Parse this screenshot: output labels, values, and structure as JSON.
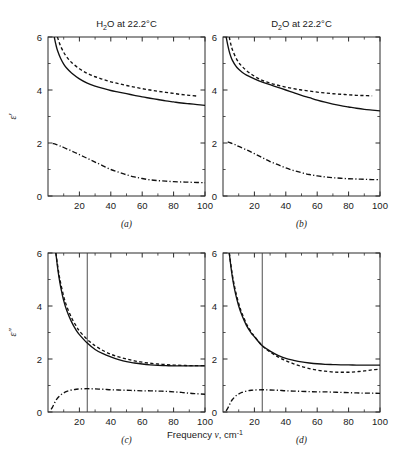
{
  "figure": {
    "x_axis_label_prefix": "Frequency ",
    "x_axis_label_symbol": "ν",
    "x_axis_label_unit": ", cm",
    "x_axis_label_unit_exp": "-1",
    "y_label_top": "ε′",
    "y_label_bottom": "ε″",
    "line_color": "#111111",
    "axis_color": "#2b2b2b"
  },
  "chart_data": [
    {
      "id": "a",
      "type": "line",
      "panel_letter": "(a)",
      "title_main": "H",
      "title_sub": "2",
      "title_rest": "O at 22.2°C",
      "title": "H2O at 22.2°C",
      "xlabel": "Frequency ν, cm-1",
      "ylabel": "ε′",
      "xlim": [
        0,
        100
      ],
      "ylim": [
        0,
        6
      ],
      "xticks": [
        20,
        40,
        60,
        80,
        100
      ],
      "xticklabels": [
        "20",
        "40",
        "60",
        "80",
        "100"
      ],
      "yticks": [
        0,
        2,
        4,
        6
      ],
      "yticklabels": [
        "0",
        "2",
        "4",
        "6"
      ],
      "grid": false,
      "legend": "none",
      "marker_line_x": null,
      "series": [
        {
          "name": "solid",
          "style": "solid",
          "x": [
            4,
            5,
            6,
            8,
            10,
            12,
            15,
            20,
            25,
            30,
            35,
            40,
            45,
            50,
            55,
            60,
            65,
            70,
            75,
            80,
            85,
            90,
            95,
            100
          ],
          "y": [
            6.0,
            5.72,
            5.5,
            5.2,
            4.98,
            4.82,
            4.64,
            4.42,
            4.26,
            4.15,
            4.06,
            3.98,
            3.92,
            3.86,
            3.8,
            3.74,
            3.69,
            3.64,
            3.59,
            3.55,
            3.51,
            3.48,
            3.45,
            3.42
          ]
        },
        {
          "name": "dashed",
          "style": "dashed",
          "x": [
            6,
            7,
            8,
            10,
            12,
            15,
            20,
            25,
            30,
            35,
            40,
            45,
            50,
            55,
            60,
            65,
            70,
            75,
            80,
            85,
            90,
            95
          ],
          "y": [
            6.0,
            5.82,
            5.66,
            5.42,
            5.24,
            5.04,
            4.8,
            4.63,
            4.5,
            4.4,
            4.31,
            4.24,
            4.17,
            4.11,
            4.05,
            4.0,
            3.95,
            3.91,
            3.87,
            3.83,
            3.8,
            3.77
          ]
        },
        {
          "name": "dashdot",
          "style": "dashdot",
          "x": [
            3,
            5,
            8,
            10,
            15,
            20,
            25,
            30,
            35,
            40,
            45,
            50,
            55,
            60,
            65,
            70,
            75,
            80,
            85,
            90,
            95,
            100
          ],
          "y": [
            1.98,
            1.95,
            1.88,
            1.83,
            1.7,
            1.56,
            1.42,
            1.28,
            1.14,
            1.0,
            0.9,
            0.8,
            0.72,
            0.66,
            0.61,
            0.58,
            0.56,
            0.54,
            0.53,
            0.52,
            0.51,
            0.5
          ]
        }
      ]
    },
    {
      "id": "b",
      "type": "line",
      "panel_letter": "(b)",
      "title_main": "D",
      "title_sub": "2",
      "title_rest": "O at 22.2°C",
      "title": "D2O at 22.2°C",
      "xlabel": "Frequency ν, cm-1",
      "ylabel": "ε′",
      "xlim": [
        0,
        100
      ],
      "ylim": [
        0,
        6
      ],
      "xticks": [
        20,
        40,
        60,
        80,
        100
      ],
      "xticklabels": [
        "20",
        "40",
        "60",
        "80",
        "100"
      ],
      "yticks": [
        0,
        2,
        4,
        6
      ],
      "yticklabels": [
        "0",
        "2",
        "4",
        "6"
      ],
      "grid": false,
      "legend": "none",
      "marker_line_x": null,
      "series": [
        {
          "name": "solid",
          "style": "solid",
          "x": [
            2,
            3,
            4,
            5,
            6,
            8,
            10,
            12,
            15,
            20,
            25,
            30,
            35,
            40,
            45,
            50,
            55,
            60,
            65,
            70,
            75,
            80,
            85,
            90,
            95,
            100
          ],
          "y": [
            6.0,
            5.7,
            5.45,
            5.26,
            5.12,
            4.92,
            4.78,
            4.68,
            4.56,
            4.42,
            4.3,
            4.2,
            4.1,
            4.0,
            3.9,
            3.8,
            3.71,
            3.62,
            3.54,
            3.47,
            3.41,
            3.36,
            3.31,
            3.27,
            3.24,
            3.21
          ]
        },
        {
          "name": "dashed",
          "style": "dashed",
          "x": [
            4,
            5,
            6,
            8,
            10,
            12,
            15,
            20,
            25,
            30,
            35,
            40,
            45,
            50,
            55,
            60,
            65,
            70,
            75,
            80,
            85,
            90,
            95
          ],
          "y": [
            6.0,
            5.72,
            5.52,
            5.24,
            5.04,
            4.9,
            4.73,
            4.52,
            4.36,
            4.26,
            4.18,
            4.11,
            4.05,
            4.0,
            3.96,
            3.92,
            3.89,
            3.86,
            3.84,
            3.82,
            3.8,
            3.79,
            3.78
          ]
        },
        {
          "name": "dashdot",
          "style": "dashdot",
          "x": [
            3,
            5,
            8,
            10,
            15,
            20,
            25,
            30,
            35,
            40,
            45,
            50,
            55,
            60,
            65,
            70,
            75,
            80,
            85,
            90,
            95,
            100
          ],
          "y": [
            2.04,
            2.0,
            1.93,
            1.87,
            1.74,
            1.6,
            1.45,
            1.3,
            1.18,
            1.06,
            0.96,
            0.88,
            0.81,
            0.76,
            0.72,
            0.69,
            0.67,
            0.65,
            0.64,
            0.63,
            0.62,
            0.62
          ]
        }
      ]
    },
    {
      "id": "c",
      "type": "line",
      "panel_letter": "(c)",
      "title": "",
      "xlabel": "Frequency ν, cm-1",
      "ylabel": "ε″",
      "xlim": [
        0,
        100
      ],
      "ylim": [
        0,
        6
      ],
      "xticks": [
        20,
        40,
        60,
        80,
        100
      ],
      "xticklabels": [
        "20",
        "40",
        "60",
        "80",
        "100"
      ],
      "yticks": [
        0,
        2,
        4,
        6
      ],
      "yticklabels": [
        "0",
        "2",
        "4",
        "6"
      ],
      "grid": false,
      "legend": "none",
      "marker_line_x": 25,
      "series": [
        {
          "name": "solid",
          "style": "solid",
          "x": [
            5,
            6,
            7,
            8,
            10,
            12,
            15,
            18,
            20,
            25,
            30,
            35,
            40,
            45,
            50,
            55,
            60,
            65,
            70,
            75,
            80,
            85,
            90,
            95,
            100
          ],
          "y": [
            6.0,
            5.5,
            5.08,
            4.74,
            4.2,
            3.82,
            3.4,
            3.08,
            2.92,
            2.6,
            2.36,
            2.2,
            2.08,
            1.98,
            1.9,
            1.85,
            1.81,
            1.78,
            1.76,
            1.75,
            1.74,
            1.74,
            1.74,
            1.74,
            1.74
          ]
        },
        {
          "name": "dashed",
          "style": "dashed",
          "x": [
            5,
            6,
            7,
            8,
            10,
            12,
            15,
            18,
            20,
            25,
            30,
            35,
            40,
            45,
            50,
            55,
            60,
            65,
            70,
            75,
            80,
            85,
            90,
            95,
            100
          ],
          "y": [
            6.0,
            5.58,
            5.2,
            4.88,
            4.36,
            3.98,
            3.56,
            3.24,
            3.06,
            2.74,
            2.5,
            2.32,
            2.18,
            2.08,
            2.0,
            1.93,
            1.88,
            1.84,
            1.81,
            1.79,
            1.77,
            1.76,
            1.75,
            1.75,
            1.75
          ]
        },
        {
          "name": "dashdot",
          "style": "dashdot",
          "x": [
            2,
            3,
            4,
            5,
            6,
            8,
            10,
            12,
            15,
            18,
            20,
            25,
            30,
            35,
            40,
            45,
            50,
            55,
            60,
            65,
            70,
            75,
            80,
            85,
            90,
            95,
            100
          ],
          "y": [
            0.1,
            0.2,
            0.32,
            0.43,
            0.52,
            0.64,
            0.72,
            0.78,
            0.83,
            0.86,
            0.87,
            0.88,
            0.87,
            0.86,
            0.84,
            0.83,
            0.82,
            0.81,
            0.8,
            0.8,
            0.79,
            0.78,
            0.76,
            0.74,
            0.71,
            0.69,
            0.67
          ]
        }
      ]
    },
    {
      "id": "d",
      "type": "line",
      "panel_letter": "(d)",
      "title": "",
      "xlabel": "Frequency ν, cm-1",
      "ylabel": "ε″",
      "xlim": [
        0,
        100
      ],
      "ylim": [
        0,
        6
      ],
      "xticks": [
        20,
        40,
        60,
        80,
        100
      ],
      "xticklabels": [
        "20",
        "40",
        "60",
        "80",
        "100"
      ],
      "yticks": [
        0,
        2,
        4,
        6
      ],
      "yticklabels": [
        "0",
        "2",
        "4",
        "6"
      ],
      "grid": false,
      "legend": "none",
      "marker_line_x": 25,
      "series": [
        {
          "name": "solid",
          "style": "solid",
          "x": [
            4,
            5,
            6,
            7,
            8,
            10,
            12,
            15,
            18,
            20,
            25,
            30,
            35,
            40,
            45,
            50,
            55,
            60,
            65,
            70,
            75,
            80,
            85,
            90,
            95,
            100
          ],
          "y": [
            6.0,
            5.5,
            5.08,
            4.74,
            4.46,
            4.0,
            3.66,
            3.26,
            2.98,
            2.84,
            2.5,
            2.3,
            2.14,
            2.02,
            1.95,
            1.89,
            1.85,
            1.82,
            1.8,
            1.79,
            1.78,
            1.78,
            1.77,
            1.77,
            1.77,
            1.77
          ]
        },
        {
          "name": "dashed",
          "style": "dashed",
          "x": [
            4,
            5,
            6,
            7,
            8,
            10,
            12,
            15,
            18,
            20,
            25,
            30,
            35,
            40,
            45,
            50,
            55,
            60,
            65,
            70,
            75,
            80,
            85,
            90,
            95,
            100
          ],
          "y": [
            6.0,
            5.56,
            5.16,
            4.84,
            4.56,
            4.1,
            3.74,
            3.32,
            3.02,
            2.86,
            2.5,
            2.26,
            2.08,
            1.94,
            1.82,
            1.72,
            1.64,
            1.58,
            1.54,
            1.51,
            1.5,
            1.5,
            1.52,
            1.55,
            1.59,
            1.62
          ]
        },
        {
          "name": "dashdot",
          "style": "dashdot",
          "x": [
            2,
            3,
            4,
            5,
            6,
            8,
            10,
            12,
            15,
            18,
            20,
            25,
            30,
            35,
            40,
            45,
            50,
            55,
            60,
            65,
            70,
            75,
            80,
            85,
            90,
            95,
            100
          ],
          "y": [
            0.04,
            0.14,
            0.26,
            0.38,
            0.47,
            0.6,
            0.68,
            0.74,
            0.79,
            0.82,
            0.83,
            0.84,
            0.83,
            0.82,
            0.8,
            0.79,
            0.78,
            0.77,
            0.76,
            0.76,
            0.75,
            0.74,
            0.73,
            0.72,
            0.71,
            0.71,
            0.7
          ]
        }
      ]
    }
  ]
}
